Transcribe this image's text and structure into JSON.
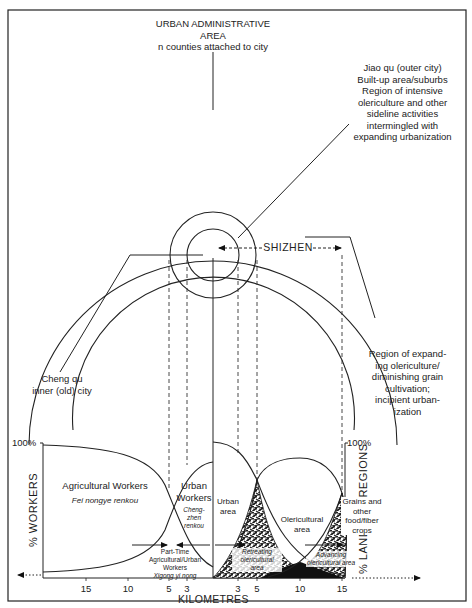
{
  "diagram": {
    "top_label": {
      "line1": "URBAN ADMINISTRATIVE",
      "line2": "AREA",
      "line3": "n counties attached to city"
    },
    "jiao_qu_label": {
      "lines": [
        "Jiao qu (outer city)",
        "Built-up area/suburbs",
        "Region of intensive",
        "olericulture and other",
        "sideline activities",
        "intermingled with",
        "expanding urbanization"
      ]
    },
    "shizhen_label": "SHIZHEN",
    "cheng_qu_label": {
      "line1": "Cheng qu",
      "line2": "inner (old) city"
    },
    "expanding_region_label": {
      "lines": [
        "Region of expand-",
        "ing olericulture/",
        "diminishing grain",
        "cultivation;",
        "incipient urban-",
        "ization"
      ]
    }
  },
  "left_chart": {
    "y_axis_label": "% WORKERS",
    "y_top_label": "100%",
    "agricultural_label": "Agricultural Workers",
    "agricultural_sub": "Fei nongye renkou",
    "urban_label_1": "Urban",
    "urban_label_2": "Workers",
    "urban_sub_1": "Cheng-",
    "urban_sub_2": "zhen",
    "urban_sub_3": "renkou",
    "parttime_1": "Part-Time",
    "parttime_2": "Agricultural/Urban",
    "parttime_3": "Workers",
    "parttime_sub": "Xigong yi nong",
    "x_ticks": [
      "15",
      "10",
      "5",
      "3"
    ]
  },
  "right_chart": {
    "y_axis_label": "% LAND USE REGIONS",
    "y_top_label": "100%",
    "urban_area_1": "Urban",
    "urban_area_2": "area",
    "olericultural_1": "Olericultural",
    "olericultural_2": "area",
    "grains_1": "Grains and",
    "grains_2": "other",
    "grains_3": "food/fiber",
    "grains_4": "crops",
    "retreating_1": "Retreating",
    "retreating_2": "olericultural",
    "retreating_3": "area",
    "advancing_1": "Advancing",
    "advancing_2": "olericultural area",
    "x_ticks": [
      "3",
      "5",
      "10",
      "15"
    ]
  },
  "x_axis_label": "KILOMETRES"
}
